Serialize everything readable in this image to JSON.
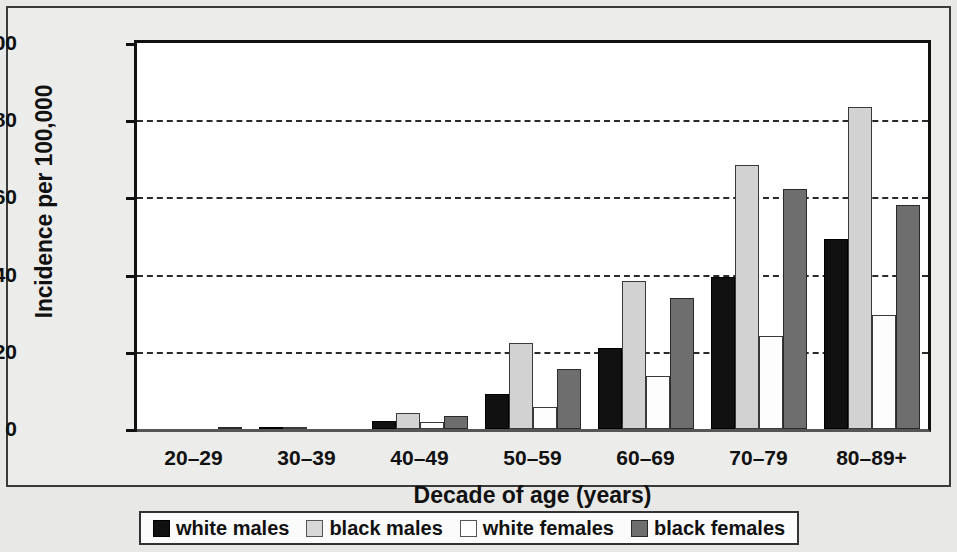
{
  "chart_data": {
    "type": "bar",
    "title": "",
    "xlabel": "Decade of age (years)",
    "ylabel": "Incidence per 100,000",
    "categories": [
      "20–29",
      "30–39",
      "40–49",
      "50–59",
      "60–69",
      "70–79",
      "80–89+"
    ],
    "series": [
      {
        "name": "white males",
        "color": "#111111",
        "values": [
          0,
          0.4,
          2.2,
          9.0,
          21.0,
          39.4,
          49.2
        ]
      },
      {
        "name": "black males",
        "color": "#d2d2d2",
        "values": [
          0,
          0.2,
          4.2,
          22.3,
          38.3,
          68.5,
          83.3
        ]
      },
      {
        "name": "white females",
        "color": "#ffffff",
        "values": [
          0,
          0,
          1.7,
          5.7,
          13.7,
          24.2,
          29.6
        ]
      },
      {
        "name": "black females",
        "color": "#6e6e6e",
        "values": [
          0.5,
          0,
          3.3,
          15.6,
          34.0,
          62.2,
          58.0
        ]
      }
    ],
    "ylim": [
      0,
      100
    ],
    "yticks": [
      0,
      20,
      40,
      60,
      80,
      100
    ],
    "ytick_labels": [
      "0",
      "20",
      "40",
      "60",
      "80",
      "100"
    ],
    "gridlines": [
      20,
      40,
      60,
      80
    ],
    "grid": true,
    "grid_style": "dashed-horizontal",
    "legend_position": "bottom-center"
  }
}
